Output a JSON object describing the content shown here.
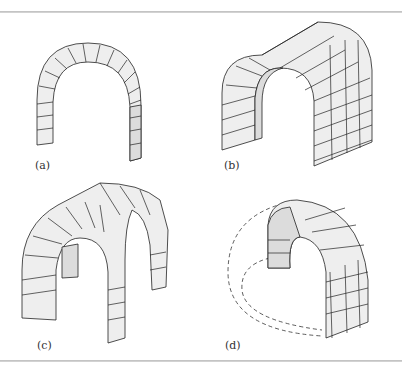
{
  "figure": {
    "panels": [
      {
        "id": "a",
        "label": "(a)",
        "description": "Simple round arch of voussoir stones"
      },
      {
        "id": "b",
        "label": "(b)",
        "description": "Barrel vault of brick courses"
      },
      {
        "id": "c",
        "label": "(c)",
        "description": "Groin vault formed by intersecting barrel vaults"
      },
      {
        "id": "d",
        "label": "(d)",
        "description": "Dome (cutaway) with dashed outline of full hemisphere"
      }
    ]
  },
  "colors": {
    "stone_fill": "#eeeeee",
    "stone_shade": "#dcdcdc",
    "outline": "#222222",
    "rule": "#c8c8c8"
  }
}
